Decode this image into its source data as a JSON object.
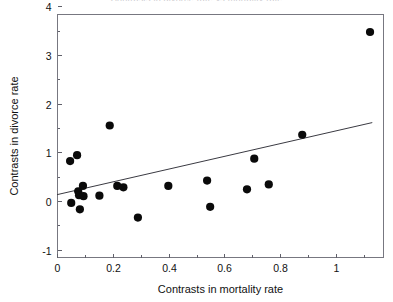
{
  "chart_data": {
    "type": "scatter",
    "title": "Contrasts in divorce rate vs mortality rate",
    "xlabel": "Contrasts in mortality rate",
    "ylabel": "Contrasts in divorce rate",
    "xlim": [
      0,
      1.17
    ],
    "ylim": [
      -1,
      4
    ],
    "xticks": [
      0,
      0.2,
      0.4,
      0.6,
      0.8,
      1
    ],
    "xtick_labels": [
      "0",
      "0.2",
      "0.4",
      "0.6",
      "0.8",
      "1"
    ],
    "yticks": [
      -1,
      0,
      1,
      2,
      3,
      4
    ],
    "ytick_labels": [
      "-1",
      "0",
      "1",
      "2",
      "3",
      "4"
    ],
    "x_minor_ticks": [
      0.1,
      0.3,
      0.5,
      0.7,
      0.9,
      1.1
    ],
    "y_minor_ticks": [
      -0.5,
      0.5,
      1.5,
      2.5,
      3.5
    ],
    "grid": false,
    "legend": "none",
    "point_color": "#0a0a0a",
    "point_radius": 4.1,
    "line_color": "#3a3a42",
    "frame_color": "#777780",
    "points": [
      {
        "x": 0.047,
        "y": 0.82
      },
      {
        "x": 0.051,
        "y": -0.04
      },
      {
        "x": 0.072,
        "y": 0.94
      },
      {
        "x": 0.076,
        "y": 0.2
      },
      {
        "x": 0.079,
        "y": 0.12
      },
      {
        "x": 0.082,
        "y": -0.17
      },
      {
        "x": 0.093,
        "y": 0.31
      },
      {
        "x": 0.095,
        "y": 0.1
      },
      {
        "x": 0.152,
        "y": 0.11
      },
      {
        "x": 0.189,
        "y": 1.55
      },
      {
        "x": 0.216,
        "y": 0.31
      },
      {
        "x": 0.238,
        "y": 0.28
      },
      {
        "x": 0.29,
        "y": -0.34
      },
      {
        "x": 0.399,
        "y": 0.31
      },
      {
        "x": 0.538,
        "y": 0.42
      },
      {
        "x": 0.549,
        "y": -0.12
      },
      {
        "x": 0.681,
        "y": 0.24
      },
      {
        "x": 0.707,
        "y": 0.87
      },
      {
        "x": 0.759,
        "y": 0.34
      },
      {
        "x": 0.879,
        "y": 1.36
      },
      {
        "x": 1.122,
        "y": 3.47
      }
    ],
    "trend_line": {
      "x0": 0.0,
      "y0": 0.13,
      "x1": 1.13,
      "y1": 1.61
    }
  }
}
